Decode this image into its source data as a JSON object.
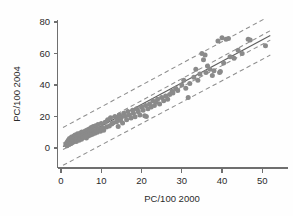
{
  "chart_data": {
    "type": "scatter",
    "title": "",
    "subtitle": "",
    "xlabel": "PC/100 2000",
    "ylabel": "PC/100 2004",
    "xlim": [
      -2,
      55
    ],
    "ylim": [
      -10,
      85
    ],
    "xticks": [
      0,
      10,
      20,
      30,
      40,
      50
    ],
    "yticks": [
      0,
      20,
      40,
      60,
      80
    ],
    "xtick_labels": [
      "0",
      "10",
      "20",
      "30",
      "40",
      "50"
    ],
    "ytick_labels": [
      "0",
      "20",
      "40",
      "60",
      "80"
    ],
    "grid": false,
    "legend": null,
    "legend_position": "none",
    "annotations": [],
    "point_color": "#8a8a8a",
    "point_radius": 2.5,
    "line_color": "#5e5e5e",
    "band_color": "#8e8e8e",
    "background_color": "#fefefe",
    "axis_color": "#6f6f6f",
    "series": [
      {
        "name": "observations",
        "marker": "filled-circle",
        "points": [
          [
            1.2,
            2.0
          ],
          [
            1.4,
            3.2
          ],
          [
            1.5,
            1.5
          ],
          [
            1.6,
            4.0
          ],
          [
            1.7,
            2.6
          ],
          [
            1.8,
            5.0
          ],
          [
            1.9,
            3.4
          ],
          [
            2.0,
            2.2
          ],
          [
            2.1,
            6.0
          ],
          [
            2.2,
            4.4
          ],
          [
            2.3,
            3.0
          ],
          [
            2.4,
            5.6
          ],
          [
            2.5,
            2.8
          ],
          [
            2.6,
            7.0
          ],
          [
            2.7,
            4.8
          ],
          [
            2.8,
            3.6
          ],
          [
            2.9,
            6.4
          ],
          [
            3.0,
            5.2
          ],
          [
            3.1,
            3.8
          ],
          [
            3.2,
            7.6
          ],
          [
            3.3,
            6.0
          ],
          [
            3.4,
            4.6
          ],
          [
            3.5,
            8.2
          ],
          [
            3.6,
            5.4
          ],
          [
            3.7,
            6.8
          ],
          [
            3.8,
            4.2
          ],
          [
            3.9,
            7.2
          ],
          [
            4.0,
            5.8
          ],
          [
            4.1,
            9.0
          ],
          [
            4.2,
            6.6
          ],
          [
            4.4,
            7.8
          ],
          [
            4.5,
            5.0
          ],
          [
            4.6,
            8.6
          ],
          [
            4.7,
            6.2
          ],
          [
            4.8,
            9.6
          ],
          [
            5.0,
            7.4
          ],
          [
            5.1,
            5.6
          ],
          [
            5.2,
            10.2
          ],
          [
            5.4,
            8.0
          ],
          [
            5.5,
            6.8
          ],
          [
            5.6,
            9.2
          ],
          [
            5.8,
            7.0
          ],
          [
            6.0,
            10.8
          ],
          [
            6.1,
            8.4
          ],
          [
            6.3,
            6.4
          ],
          [
            6.5,
            11.4
          ],
          [
            6.6,
            9.0
          ],
          [
            6.8,
            7.6
          ],
          [
            7.0,
            12.0
          ],
          [
            7.1,
            9.8
          ],
          [
            7.3,
            8.2
          ],
          [
            7.5,
            13.0
          ],
          [
            7.6,
            10.4
          ],
          [
            7.8,
            8.8
          ],
          [
            8.0,
            13.6
          ],
          [
            8.2,
            11.0
          ],
          [
            8.4,
            9.4
          ],
          [
            8.6,
            14.2
          ],
          [
            8.8,
            11.6
          ],
          [
            9.0,
            10.0
          ],
          [
            9.2,
            15.0
          ],
          [
            9.5,
            12.2
          ],
          [
            9.8,
            10.6
          ],
          [
            10.0,
            15.6
          ],
          [
            10.3,
            12.8
          ],
          [
            10.6,
            11.2
          ],
          [
            11.0,
            16.4
          ],
          [
            11.3,
            13.4
          ],
          [
            11.6,
            18.0
          ],
          [
            12.0,
            14.0
          ],
          [
            12.3,
            19.2
          ],
          [
            12.6,
            15.2
          ],
          [
            13.0,
            16.0
          ],
          [
            13.4,
            20.0
          ],
          [
            13.8,
            16.6
          ],
          [
            14.0,
            18.8
          ],
          [
            14.2,
            13.6
          ],
          [
            14.5,
            21.0
          ],
          [
            14.8,
            17.4
          ],
          [
            15.0,
            19.6
          ],
          [
            15.3,
            15.8
          ],
          [
            15.6,
            22.0
          ],
          [
            16.0,
            20.2
          ],
          [
            16.3,
            18.0
          ],
          [
            16.6,
            23.2
          ],
          [
            17.0,
            21.0
          ],
          [
            17.4,
            19.0
          ],
          [
            17.8,
            24.0
          ],
          [
            18.0,
            22.0
          ],
          [
            18.4,
            19.8
          ],
          [
            18.8,
            25.0
          ],
          [
            19.2,
            23.0
          ],
          [
            19.6,
            21.0
          ],
          [
            20.0,
            26.0
          ],
          [
            20.4,
            24.0
          ],
          [
            20.8,
            20.4
          ],
          [
            21.0,
            27.0
          ],
          [
            21.2,
            20.0
          ],
          [
            21.6,
            25.0
          ],
          [
            22.0,
            28.0
          ],
          [
            22.4,
            26.0
          ],
          [
            22.8,
            30.0
          ],
          [
            23.2,
            27.0
          ],
          [
            23.6,
            29.0
          ],
          [
            24.0,
            31.0
          ],
          [
            24.5,
            28.0
          ],
          [
            25.0,
            32.0
          ],
          [
            25.5,
            30.0
          ],
          [
            26.0,
            33.0
          ],
          [
            26.5,
            31.0
          ],
          [
            27.0,
            34.0
          ],
          [
            27.6,
            36.0
          ],
          [
            27.8,
            35.0
          ],
          [
            28.5,
            38.0
          ],
          [
            29.0,
            36.5
          ],
          [
            30.0,
            40.0
          ],
          [
            30.5,
            43.0
          ],
          [
            31.0,
            38.0
          ],
          [
            31.6,
            32.0
          ],
          [
            32.0,
            41.0
          ],
          [
            33.0,
            45.0
          ],
          [
            33.5,
            50.0
          ],
          [
            34.0,
            43.0
          ],
          [
            34.5,
            47.0
          ],
          [
            35.0,
            60.0
          ],
          [
            35.4,
            56.0
          ],
          [
            35.8,
            59.0
          ],
          [
            36.0,
            48.0
          ],
          [
            36.4,
            52.0
          ],
          [
            37.0,
            50.0
          ],
          [
            37.6,
            46.0
          ],
          [
            38.0,
            49.0
          ],
          [
            39.0,
            68.0
          ],
          [
            39.4,
            48.0
          ],
          [
            39.6,
            48.5
          ],
          [
            40.0,
            70.0
          ],
          [
            40.4,
            54.0
          ],
          [
            41.0,
            69.0
          ],
          [
            41.6,
            69.5
          ],
          [
            42.0,
            58.0
          ],
          [
            43.0,
            57.0
          ],
          [
            44.0,
            62.0
          ],
          [
            45.0,
            60.0
          ],
          [
            46.5,
            69.0
          ],
          [
            47.0,
            68.5
          ],
          [
            50.8,
            65.0
          ]
        ]
      }
    ],
    "fit_line": {
      "name": "regression line",
      "style": "solid",
      "x_start": 0.5,
      "y_start": 1.0,
      "x_end": 52.0,
      "y_end": 71.5
    },
    "bands": [
      {
        "name": "inner confidence band upper",
        "style": "dashed",
        "x_start": 0.5,
        "y_start": 3.0,
        "x_end": 52.0,
        "y_end": 74.5
      },
      {
        "name": "inner confidence band lower",
        "style": "dashed",
        "x_start": 0.5,
        "y_start": -1.0,
        "x_end": 52.0,
        "y_end": 68.5
      },
      {
        "name": "outer prediction band upper",
        "style": "dashed",
        "x_start": 0.5,
        "y_start": 13.0,
        "x_end": 52.0,
        "y_end": 84.0
      },
      {
        "name": "outer prediction band lower",
        "style": "dashed",
        "x_start": 0.5,
        "y_start": -11.0,
        "x_end": 52.0,
        "y_end": 59.0
      }
    ]
  }
}
